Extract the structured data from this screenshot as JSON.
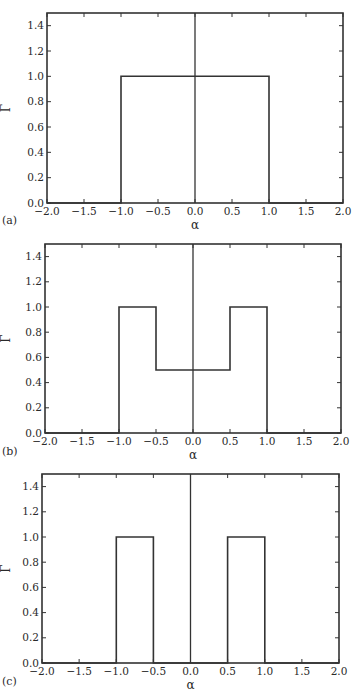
{
  "figure": {
    "panel_labels": [
      "(a)",
      "(b)",
      "(c)"
    ],
    "line_color": "#333333",
    "background": "#ffffff"
  },
  "chart_data": [
    {
      "type": "line",
      "panel": "(a)",
      "title": "",
      "xlabel": "α",
      "ylabel": "Γ",
      "xlim": [
        -2.0,
        2.0
      ],
      "ylim": [
        0.0,
        1.5
      ],
      "xticks": [
        "−2.0",
        "−1.5",
        "−1.0",
        "−0.5",
        "0.0",
        "0.5",
        "1.0",
        "1.5",
        "2.0"
      ],
      "yticks": [
        "0.0",
        "0.2",
        "0.4",
        "0.6",
        "0.8",
        "1.0",
        "1.2",
        "1.4"
      ],
      "grid": false,
      "legend": null,
      "series": [
        {
          "name": "Γ(α)",
          "x": [
            -2.0,
            -1.0,
            -1.0,
            1.0,
            1.0,
            2.0
          ],
          "y": [
            0.0,
            0.0,
            1.0,
            1.0,
            0.0,
            0.0
          ]
        },
        {
          "name": "center line",
          "x": [
            0.0,
            0.0
          ],
          "y": [
            0.0,
            1.5
          ]
        }
      ]
    },
    {
      "type": "line",
      "panel": "(b)",
      "title": "",
      "xlabel": "α",
      "ylabel": "Γ",
      "xlim": [
        -2.0,
        2.0
      ],
      "ylim": [
        0.0,
        1.5
      ],
      "xticks": [
        "−2.0",
        "−1.5",
        "−1.0",
        "−0.5",
        "0.0",
        "0.5",
        "1.0",
        "1.5",
        "2.0"
      ],
      "yticks": [
        "0.0",
        "0.2",
        "0.4",
        "0.6",
        "0.8",
        "1.0",
        "1.2",
        "1.4"
      ],
      "grid": false,
      "legend": null,
      "series": [
        {
          "name": "Γ(α)",
          "x": [
            -2.0,
            -1.0,
            -1.0,
            -0.5,
            -0.5,
            0.5,
            0.5,
            1.0,
            1.0,
            2.0
          ],
          "y": [
            0.0,
            0.0,
            1.0,
            1.0,
            0.5,
            0.5,
            1.0,
            1.0,
            0.0,
            0.0
          ]
        },
        {
          "name": "center line",
          "x": [
            0.0,
            0.0
          ],
          "y": [
            0.0,
            1.5
          ]
        }
      ]
    },
    {
      "type": "line",
      "panel": "(c)",
      "title": "",
      "xlabel": "α",
      "ylabel": "Γ",
      "xlim": [
        -2.0,
        2.0
      ],
      "ylim": [
        0.0,
        1.5
      ],
      "xticks": [
        "−2.0",
        "−1.5",
        "−1.0",
        "−0.5",
        "0.0",
        "0.5",
        "1.0",
        "1.5",
        "2.0"
      ],
      "yticks": [
        "0.0",
        "0.2",
        "0.4",
        "0.6",
        "0.8",
        "1.0",
        "1.2",
        "1.4"
      ],
      "grid": false,
      "legend": null,
      "series": [
        {
          "name": "Γ(α)",
          "x": [
            -2.0,
            -1.0,
            -1.0,
            -0.5,
            -0.5,
            0.5,
            0.5,
            1.0,
            1.0,
            2.0
          ],
          "y": [
            0.0,
            0.0,
            1.0,
            1.0,
            0.0,
            0.0,
            1.0,
            1.0,
            0.0,
            0.0
          ]
        },
        {
          "name": "center line",
          "x": [
            0.0,
            0.0
          ],
          "y": [
            0.0,
            1.5
          ]
        }
      ]
    }
  ]
}
